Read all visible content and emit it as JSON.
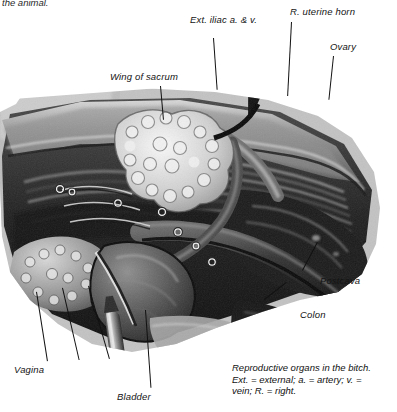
{
  "figure": {
    "cut_text": "the animal.",
    "caption_lines": [
      "Reproductive organs in the bitch.",
      "Ext. = external; a. = artery; v. =",
      "vein; R. = right."
    ],
    "caption_full": "Reproductive organs in the bitch. Ext. = external; a. = artery; v. = vein; R. = right."
  },
  "labels": [
    {
      "id": "ext-iliac",
      "text": "Ext. iliac a. & v."
    },
    {
      "id": "r-uterine-horn",
      "text": "R. uterine horn"
    },
    {
      "id": "ovary",
      "text": "Ovary"
    },
    {
      "id": "wing-of-sacrum",
      "text": "Wing of sacrum"
    },
    {
      "id": "postcava",
      "text": "Postcava"
    },
    {
      "id": "colon",
      "text": "Colon"
    },
    {
      "id": "vagina",
      "text": "Vagina"
    },
    {
      "id": "bladder",
      "text": "Bladder"
    }
  ],
  "colors": {
    "text": "#141414",
    "leader": "#111111",
    "page_background": "#ffffff",
    "plate_light": "#c9c9c9",
    "plate_mid": "#8a8a8a",
    "plate_dark": "#2e2e2e",
    "plate_black": "#0d0d0d",
    "highlight": "#efefef"
  }
}
